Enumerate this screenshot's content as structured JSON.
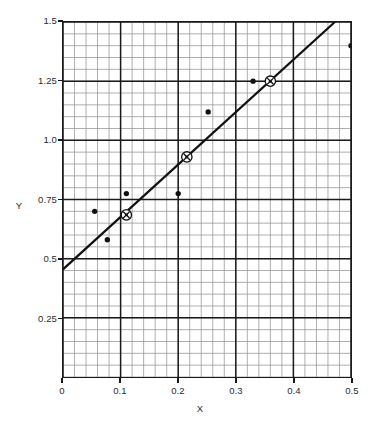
{
  "chart_data": {
    "type": "scatter",
    "title": "",
    "subtitle": "",
    "xlabel": "X",
    "ylabel": "Y",
    "xlim": [
      0,
      0.5
    ],
    "ylim": [
      0,
      1.5
    ],
    "xticks": [
      0,
      0.1,
      0.2,
      0.3,
      0.4,
      0.5
    ],
    "xtick_labels": [
      "0",
      "0.1",
      "0.2",
      "0.3",
      "0.4",
      "0.5"
    ],
    "yticks": [
      0.25,
      0.5,
      0.75,
      1.0,
      1.25,
      1.5
    ],
    "ytick_labels": [
      "0.25",
      "0.5",
      "0.75",
      "1.0",
      "1.25",
      "1.5"
    ],
    "grid": true,
    "grid_major_color": "#1a1a1a",
    "grid_minor_color": "#9a9a9a",
    "minor_per_major_x": 5,
    "minor_per_major_y": 5,
    "legend": null,
    "legend_position": "none",
    "series": [
      {
        "name": "data points",
        "marker": "filled-circle",
        "color": "#111111",
        "points": [
          {
            "x": 0.055,
            "y": 0.7,
            "circled": false
          },
          {
            "x": 0.077,
            "y": 0.58,
            "circled": false
          },
          {
            "x": 0.11,
            "y": 0.775,
            "circled": false
          },
          {
            "x": 0.11,
            "y": 0.685,
            "circled": true
          },
          {
            "x": 0.2,
            "y": 0.775,
            "circled": false
          },
          {
            "x": 0.215,
            "y": 0.93,
            "circled": true
          },
          {
            "x": 0.252,
            "y": 1.12,
            "circled": false
          },
          {
            "x": 0.33,
            "y": 1.25,
            "circled": false
          },
          {
            "x": 0.36,
            "y": 1.25,
            "circled": true
          },
          {
            "x": 0.5,
            "y": 1.4,
            "circled": false
          }
        ]
      },
      {
        "name": "fit line",
        "marker": "none",
        "color": "#111111",
        "line": {
          "x1": 0.0,
          "y1": 0.455,
          "x2": 0.472,
          "y2": 1.5
        }
      }
    ]
  },
  "axes": {
    "x_axis_label": "X",
    "y_axis_label": "Y"
  }
}
